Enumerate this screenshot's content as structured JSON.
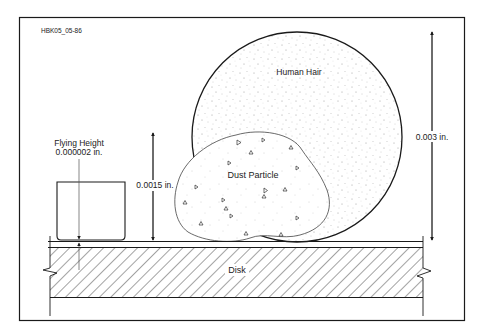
{
  "figure_id": "HBK05_05-86",
  "labels": {
    "hair": "Human Hair",
    "dust": "Dust Particle",
    "disk": "Disk",
    "flying_height_title": "Flying Height",
    "flying_height_value": "0.000002 in.",
    "dust_height": "0.0015 in.",
    "hair_height": "0.003 in."
  },
  "colors": {
    "line": "#1a1a1a",
    "speckle": "#9a9a9a",
    "background": "#ffffff"
  }
}
